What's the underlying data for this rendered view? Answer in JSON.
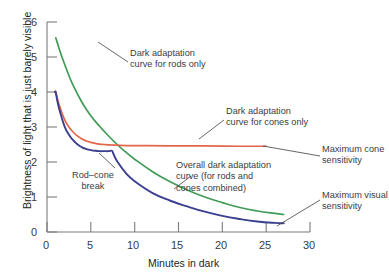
{
  "chart_data": {
    "type": "line",
    "title": "",
    "xlabel": "Minutes in dark",
    "ylabel": "Brightness of light that is just barely visible",
    "xlim": [
      0,
      30
    ],
    "ylim": [
      0,
      6
    ],
    "xticks": [
      "0",
      "5",
      "10",
      "15",
      "20",
      "25",
      "30"
    ],
    "yticks": [
      "0",
      "1",
      "2",
      "3",
      "4",
      "5",
      "6"
    ],
    "grid": false,
    "legend": "none (inline annotations)",
    "series": [
      {
        "name": "Dark adaptation curve for rods only",
        "color": "#3f9b56",
        "x": [
          1.0,
          1.5,
          2.0,
          2.5,
          3.0,
          4.0,
          5.0,
          6.0,
          7.0,
          8.0,
          9.0,
          10.0,
          12.0,
          14.0,
          16.0,
          18.0,
          20.0,
          22.0,
          24.0,
          26.0,
          27.0
        ],
        "y": [
          5.55,
          5.15,
          4.8,
          4.47,
          4.18,
          3.7,
          3.32,
          3.02,
          2.75,
          2.5,
          2.28,
          2.08,
          1.73,
          1.44,
          1.2,
          1.0,
          0.84,
          0.7,
          0.6,
          0.53,
          0.5
        ]
      },
      {
        "name": "Dark adaptation curve for cones only",
        "color": "#e2674a",
        "x": [
          0.9,
          1.0,
          1.2,
          1.5,
          2.0,
          2.5,
          3.0,
          3.5,
          4.0,
          4.5,
          5.0,
          5.5,
          6.0,
          6.5,
          7.0,
          8.0,
          10.0,
          14.0,
          18.0,
          22.0,
          25.0
        ],
        "y": [
          4.0,
          4.0,
          3.8,
          3.55,
          3.22,
          3.0,
          2.85,
          2.74,
          2.66,
          2.6,
          2.56,
          2.53,
          2.51,
          2.5,
          2.49,
          2.48,
          2.47,
          2.46,
          2.46,
          2.45,
          2.45
        ]
      },
      {
        "name": "Overall dark adaptation curve (for rods and cones combined)",
        "color": "#3b3f8f",
        "x": [
          0.9,
          1.0,
          1.2,
          1.5,
          2.0,
          2.5,
          3.0,
          3.5,
          4.0,
          4.5,
          5.0,
          5.5,
          6.0,
          6.5,
          7.0,
          7.4,
          7.6,
          8.0,
          9.0,
          10.0,
          12.0,
          14.0,
          16.0,
          18.0,
          20.0,
          22.0,
          24.0,
          26.0,
          27.0
        ],
        "y": [
          4.0,
          3.98,
          3.72,
          3.42,
          3.02,
          2.78,
          2.62,
          2.5,
          2.42,
          2.37,
          2.34,
          2.32,
          2.31,
          2.31,
          2.31,
          2.32,
          2.22,
          2.02,
          1.68,
          1.45,
          1.12,
          0.9,
          0.73,
          0.58,
          0.46,
          0.37,
          0.3,
          0.26,
          0.25
        ]
      }
    ],
    "annotations": [
      {
        "key": "rods",
        "text": "Dark adaptation\ncurve for rods only"
      },
      {
        "key": "cones",
        "text": "Dark adaptation\ncurve for cones only"
      },
      {
        "key": "overall",
        "text": "Overall dark adaptation\ncurve (for rods and\ncones combined)"
      },
      {
        "key": "break",
        "text": "Rod–cone\nbreak"
      },
      {
        "key": "max_cone",
        "text": "Maximum cone\nsensitivity"
      },
      {
        "key": "max_visual",
        "text": "Maximum visual\nsensitivity"
      }
    ],
    "colors": {
      "rods": "#3f9b56",
      "cones": "#e2674a",
      "combined": "#3b3f8f",
      "axis": "#6d6e71",
      "text": "#231f20"
    }
  }
}
